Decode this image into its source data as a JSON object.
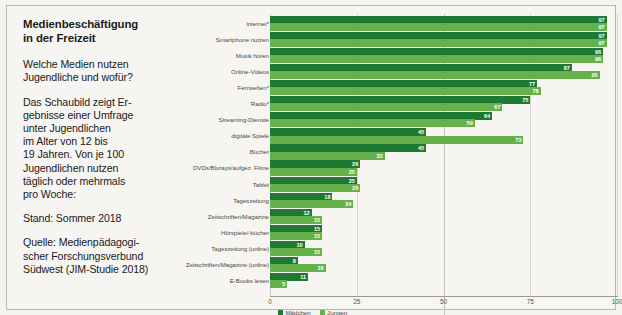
{
  "panel": {
    "headline": "Medienbeschäftigung\nin der Freizeit",
    "question": "Welche Medien nutzen\nJugendliche und wofür?",
    "description": "Das Schaubild zeigt Er-\ngebnisse einer Umfrage\nunter Jugendlichen\nim Alter von 12 bis\n19 Jahren. Von je 100\nJugendlichen nutzen\ntäglich oder mehrmals\npro Woche:",
    "status": "Stand: Sommer 2018",
    "source": "Quelle: Medienpädagogi-\nscher Forschungsverbund\nSüdwest (JIM-Studie 2018)"
  },
  "colors": {
    "maedchen": "#1c7a32",
    "jungen": "#67b14b",
    "background": "#f6f5f2"
  },
  "chart_data": {
    "type": "bar",
    "orientation": "horizontal",
    "xlabel": "",
    "ylabel": "",
    "xlim": [
      0,
      100
    ],
    "xticks": [
      "0",
      "25",
      "50",
      "75",
      "100"
    ],
    "grid": true,
    "legend_position": "bottom-left",
    "categories": [
      "internet*",
      "Smartphone nutzen",
      "Musik hören",
      "Online-Videos",
      "Fernsehen*",
      "Radio*",
      "Streaming-Dienste",
      "digitale Spiele",
      "Bücher",
      "DVDs/Blurays/aufgez. Filme",
      "Tablet",
      "Tageszeitung",
      "Zeitschriften/Magazine",
      "Hörspiele/-bücher",
      "Tageszeitung (online)",
      "Zeitschriften/Magazine (online)",
      "E-Books lesen"
    ],
    "series": [
      {
        "name": "Mädchen",
        "color": "#1c7a32",
        "values": [
          97,
          97,
          96,
          87,
          77,
          75,
          64,
          45,
          45,
          26,
          25,
          18,
          12,
          15,
          10,
          8,
          11
        ]
      },
      {
        "name": "Jungen",
        "color": "#67b14b",
        "values": [
          97,
          97,
          96,
          95,
          78,
          67,
          59,
          73,
          33,
          25,
          26,
          24,
          15,
          15,
          15,
          16,
          5
        ]
      }
    ]
  }
}
